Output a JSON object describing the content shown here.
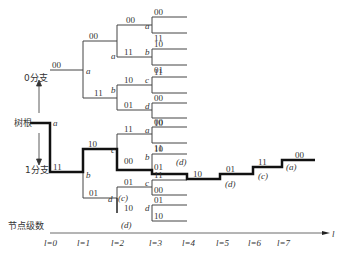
{
  "diagram": {
    "type": "convolutional code tree diagram",
    "side_labels": {
      "root": "树根",
      "branch0": "0分支",
      "branch1": "1分支",
      "level_axis": "节点级数",
      "axis_var": "l"
    },
    "levels": [
      "l=0",
      "l=1",
      "l=2",
      "l=3",
      "l=4",
      "l=5",
      "l=6",
      "l=7"
    ],
    "states": {
      "root": "a",
      "l1_top": "a",
      "l1_bottom": "b",
      "l2": [
        "a",
        "b",
        "c",
        "d"
      ],
      "l3": [
        "a",
        "b",
        "c",
        "d",
        "a",
        "b",
        "c",
        "d"
      ]
    },
    "branch_outputs": {
      "l0": [
        "00",
        "11"
      ],
      "l1": [
        "00",
        "11",
        "10",
        "01"
      ],
      "l2": [
        "00",
        "11",
        "10",
        "01",
        "11",
        "00",
        "01",
        "10"
      ],
      "l3": [
        "00",
        "11",
        "10",
        "01",
        "11",
        "00",
        "01",
        "10",
        "00",
        "11",
        "10",
        "01",
        "11",
        "00",
        "01",
        "10"
      ]
    },
    "path": {
      "outputs_after_l3": [
        "10",
        "01",
        "11",
        "00"
      ],
      "state_annotations": [
        "(d)",
        "(d)",
        "(c)",
        "(a)"
      ],
      "extra_annotations": [
        "(c)",
        "(d)",
        "(d)"
      ]
    }
  }
}
